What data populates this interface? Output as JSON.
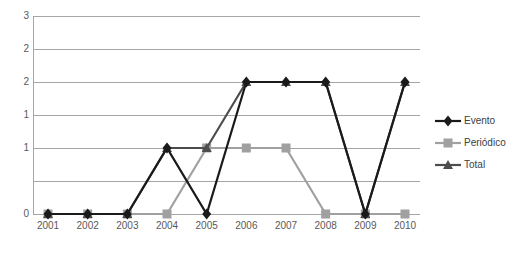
{
  "chart_data": {
    "type": "line",
    "title": "",
    "subtitle": "",
    "xlabel": "",
    "ylabel": "",
    "categories": [
      "2001",
      "2002",
      "2003",
      "2004",
      "2005",
      "2006",
      "2007",
      "2008",
      "2009",
      "2010"
    ],
    "ytick_labels": [
      "3",
      "2",
      "2",
      "1",
      "1",
      "0"
    ],
    "ytick_values": [
      3,
      2.5,
      2,
      1.5,
      1,
      0.5,
      0
    ],
    "ylim": [
      0,
      3
    ],
    "grid": true,
    "legend_position": "right",
    "series": [
      {
        "name": "Evento",
        "color": "#1a1a1a",
        "marker": "diamond",
        "values": [
          0,
          0,
          0,
          1,
          0,
          2,
          2,
          2,
          0,
          2
        ]
      },
      {
        "name": "Periódico",
        "color": "#a0a0a0",
        "marker": "square",
        "values": [
          0,
          0,
          0,
          0,
          1,
          1,
          1,
          0,
          0,
          0
        ]
      },
      {
        "name": "Total",
        "color": "#4d4d4d",
        "marker": "triangle",
        "values": [
          0,
          0,
          0,
          1,
          1,
          2,
          2,
          2,
          0,
          2
        ]
      }
    ]
  },
  "legend": {
    "items": [
      {
        "label": "Evento",
        "marker_name": "legend-marker-diamond"
      },
      {
        "label": "Periódico",
        "marker_name": "legend-marker-square"
      },
      {
        "label": "Total",
        "marker_name": "legend-marker-triangle"
      }
    ]
  },
  "colors": {
    "gridline": "#a6a6a6",
    "tick_text": "#595959",
    "legend_text": "#404040",
    "background": "#ffffff"
  }
}
